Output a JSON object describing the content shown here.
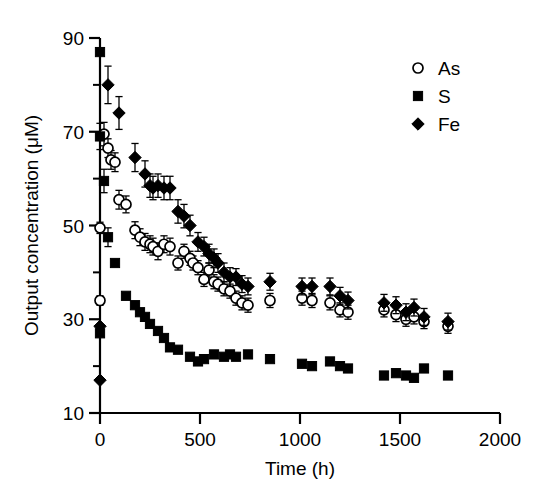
{
  "chart_data": {
    "type": "scatter",
    "title": "",
    "xlabel": "Time (h)",
    "ylabel": "Output concentration (μM)",
    "xlim": [
      0,
      2000
    ],
    "ylim": [
      10,
      90
    ],
    "xticks": [
      0,
      500,
      1000,
      1500,
      2000
    ],
    "yticks": [
      10,
      30,
      50,
      70,
      90
    ],
    "xtick_labels": [
      "0",
      "500",
      "1000",
      "1500",
      "2000"
    ],
    "ytick_labels": [
      "10",
      "30",
      "50",
      "70",
      "90"
    ],
    "x_minor_ticks": [
      250,
      750,
      1250,
      1750
    ],
    "y_minor_ticks": [
      20,
      40,
      60,
      80
    ],
    "grid": false,
    "legend_position": "top-right",
    "error_bars": true,
    "series": [
      {
        "name": "As",
        "marker": "open-circle",
        "color": "#000000",
        "points": [
          {
            "x": 0,
            "y": 49.5,
            "err": 1.2
          },
          {
            "x": 0,
            "y": 34.0,
            "err": 1.0
          },
          {
            "x": 20,
            "y": 69.5,
            "err": 2.5
          },
          {
            "x": 40,
            "y": 66.5,
            "err": 2.0
          },
          {
            "x": 55,
            "y": 64.0,
            "err": 2.0
          },
          {
            "x": 75,
            "y": 63.5,
            "err": 2.0
          },
          {
            "x": 95,
            "y": 55.5,
            "err": 2.0
          },
          {
            "x": 130,
            "y": 54.5,
            "err": 1.8
          },
          {
            "x": 175,
            "y": 49.0,
            "err": 1.8
          },
          {
            "x": 200,
            "y": 47.5,
            "err": 1.8
          },
          {
            "x": 225,
            "y": 46.5,
            "err": 1.8
          },
          {
            "x": 250,
            "y": 46.0,
            "err": 1.8
          },
          {
            "x": 265,
            "y": 45.5,
            "err": 1.8
          },
          {
            "x": 290,
            "y": 44.5,
            "err": 1.8
          },
          {
            "x": 320,
            "y": 46.0,
            "err": 1.8
          },
          {
            "x": 350,
            "y": 45.5,
            "err": 1.8
          },
          {
            "x": 390,
            "y": 42.0,
            "err": 1.5
          },
          {
            "x": 420,
            "y": 44.5,
            "err": 1.5
          },
          {
            "x": 450,
            "y": 43.0,
            "err": 1.5
          },
          {
            "x": 465,
            "y": 42.0,
            "err": 1.5
          },
          {
            "x": 490,
            "y": 41.0,
            "err": 1.5
          },
          {
            "x": 520,
            "y": 38.5,
            "err": 1.5
          },
          {
            "x": 545,
            "y": 40.5,
            "err": 1.5
          },
          {
            "x": 570,
            "y": 38.0,
            "err": 1.5
          },
          {
            "x": 590,
            "y": 37.5,
            "err": 1.5
          },
          {
            "x": 620,
            "y": 36.5,
            "err": 1.5
          },
          {
            "x": 650,
            "y": 36.0,
            "err": 1.5
          },
          {
            "x": 680,
            "y": 34.5,
            "err": 1.5
          },
          {
            "x": 710,
            "y": 33.5,
            "err": 1.5
          },
          {
            "x": 740,
            "y": 33.0,
            "err": 1.5
          },
          {
            "x": 850,
            "y": 34.0,
            "err": 1.5
          },
          {
            "x": 1010,
            "y": 34.5,
            "err": 1.5
          },
          {
            "x": 1060,
            "y": 34.0,
            "err": 1.5
          },
          {
            "x": 1150,
            "y": 33.5,
            "err": 1.5
          },
          {
            "x": 1200,
            "y": 32.0,
            "err": 1.5
          },
          {
            "x": 1240,
            "y": 31.5,
            "err": 1.5
          },
          {
            "x": 1420,
            "y": 32.0,
            "err": 1.5
          },
          {
            "x": 1480,
            "y": 31.0,
            "err": 1.5
          },
          {
            "x": 1530,
            "y": 30.0,
            "err": 1.5
          },
          {
            "x": 1570,
            "y": 30.5,
            "err": 1.5
          },
          {
            "x": 1620,
            "y": 29.5,
            "err": 1.5
          },
          {
            "x": 1740,
            "y": 28.5,
            "err": 1.5
          }
        ]
      },
      {
        "name": "S",
        "marker": "filled-square",
        "color": "#000000",
        "points": [
          {
            "x": 0,
            "y": 87.0,
            "err": 0
          },
          {
            "x": 0,
            "y": 69.0,
            "err": 2.8
          },
          {
            "x": 0,
            "y": 27.0,
            "err": 0
          },
          {
            "x": 20,
            "y": 59.5,
            "err": 2.5
          },
          {
            "x": 40,
            "y": 47.5,
            "err": 2.0
          },
          {
            "x": 75,
            "y": 42.0,
            "err": 0
          },
          {
            "x": 130,
            "y": 35.0,
            "err": 0
          },
          {
            "x": 175,
            "y": 33.0,
            "err": 0
          },
          {
            "x": 200,
            "y": 31.5,
            "err": 0
          },
          {
            "x": 225,
            "y": 30.5,
            "err": 0
          },
          {
            "x": 250,
            "y": 29.0,
            "err": 0
          },
          {
            "x": 290,
            "y": 27.5,
            "err": 0
          },
          {
            "x": 320,
            "y": 26.0,
            "err": 0
          },
          {
            "x": 350,
            "y": 24.0,
            "err": 0
          },
          {
            "x": 390,
            "y": 23.5,
            "err": 0
          },
          {
            "x": 450,
            "y": 22.0,
            "err": 0
          },
          {
            "x": 490,
            "y": 21.0,
            "err": 0
          },
          {
            "x": 520,
            "y": 21.5,
            "err": 0
          },
          {
            "x": 570,
            "y": 22.5,
            "err": 0
          },
          {
            "x": 620,
            "y": 22.0,
            "err": 0
          },
          {
            "x": 650,
            "y": 22.5,
            "err": 0
          },
          {
            "x": 680,
            "y": 22.0,
            "err": 0
          },
          {
            "x": 740,
            "y": 22.5,
            "err": 0
          },
          {
            "x": 850,
            "y": 21.5,
            "err": 0
          },
          {
            "x": 1010,
            "y": 20.5,
            "err": 0
          },
          {
            "x": 1060,
            "y": 20.0,
            "err": 0
          },
          {
            "x": 1150,
            "y": 21.0,
            "err": 0
          },
          {
            "x": 1200,
            "y": 20.0,
            "err": 0
          },
          {
            "x": 1240,
            "y": 19.5,
            "err": 0
          },
          {
            "x": 1420,
            "y": 18.0,
            "err": 0
          },
          {
            "x": 1480,
            "y": 18.5,
            "err": 0
          },
          {
            "x": 1530,
            "y": 18.0,
            "err": 0
          },
          {
            "x": 1570,
            "y": 17.5,
            "err": 0
          },
          {
            "x": 1620,
            "y": 19.5,
            "err": 0
          },
          {
            "x": 1740,
            "y": 18.0,
            "err": 0
          }
        ]
      },
      {
        "name": "Fe",
        "marker": "filled-diamond",
        "color": "#000000",
        "points": [
          {
            "x": 0,
            "y": 17.0,
            "err": 0
          },
          {
            "x": 0,
            "y": 28.5,
            "err": 0
          },
          {
            "x": 40,
            "y": 80.0,
            "err": 4.0
          },
          {
            "x": 95,
            "y": 74.0,
            "err": 3.5
          },
          {
            "x": 175,
            "y": 64.5,
            "err": 3.0
          },
          {
            "x": 225,
            "y": 61.0,
            "err": 2.8
          },
          {
            "x": 250,
            "y": 58.5,
            "err": 2.5
          },
          {
            "x": 265,
            "y": 58.0,
            "err": 2.5
          },
          {
            "x": 290,
            "y": 58.5,
            "err": 2.5
          },
          {
            "x": 320,
            "y": 58.0,
            "err": 2.5
          },
          {
            "x": 350,
            "y": 58.0,
            "err": 2.5
          },
          {
            "x": 390,
            "y": 53.0,
            "err": 2.5
          },
          {
            "x": 420,
            "y": 52.0,
            "err": 2.5
          },
          {
            "x": 450,
            "y": 50.0,
            "err": 2.2
          },
          {
            "x": 490,
            "y": 46.5,
            "err": 2.0
          },
          {
            "x": 520,
            "y": 45.5,
            "err": 2.0
          },
          {
            "x": 545,
            "y": 44.0,
            "err": 2.0
          },
          {
            "x": 570,
            "y": 43.0,
            "err": 2.0
          },
          {
            "x": 590,
            "y": 42.0,
            "err": 2.0
          },
          {
            "x": 620,
            "y": 40.0,
            "err": 2.0
          },
          {
            "x": 650,
            "y": 39.0,
            "err": 2.0
          },
          {
            "x": 680,
            "y": 39.0,
            "err": 1.8
          },
          {
            "x": 710,
            "y": 37.5,
            "err": 1.8
          },
          {
            "x": 740,
            "y": 37.0,
            "err": 1.8
          },
          {
            "x": 850,
            "y": 38.0,
            "err": 1.8
          },
          {
            "x": 1010,
            "y": 37.0,
            "err": 1.8
          },
          {
            "x": 1060,
            "y": 37.0,
            "err": 1.8
          },
          {
            "x": 1150,
            "y": 37.0,
            "err": 1.8
          },
          {
            "x": 1200,
            "y": 35.0,
            "err": 1.8
          },
          {
            "x": 1240,
            "y": 34.0,
            "err": 1.8
          },
          {
            "x": 1420,
            "y": 33.5,
            "err": 1.8
          },
          {
            "x": 1480,
            "y": 33.0,
            "err": 1.8
          },
          {
            "x": 1530,
            "y": 31.5,
            "err": 1.8
          },
          {
            "x": 1570,
            "y": 32.5,
            "err": 1.8
          },
          {
            "x": 1620,
            "y": 30.5,
            "err": 1.8
          },
          {
            "x": 1740,
            "y": 29.5,
            "err": 1.8
          }
        ]
      }
    ],
    "legend": [
      {
        "label": "As",
        "marker": "open-circle"
      },
      {
        "label": "S",
        "marker": "filled-square"
      },
      {
        "label": "Fe",
        "marker": "filled-diamond"
      }
    ]
  }
}
